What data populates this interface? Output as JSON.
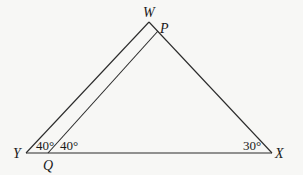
{
  "diagram": {
    "type": "geometry-triangle",
    "vertices": {
      "W": {
        "label": "W",
        "x": 149,
        "y": 22
      },
      "P": {
        "label": "P",
        "x": 158,
        "y": 27
      },
      "Y": {
        "label": "Y",
        "x": 26,
        "y": 153
      },
      "Q": {
        "label": "Q",
        "x": 48,
        "y": 153
      },
      "X": {
        "label": "X",
        "x": 272,
        "y": 153
      }
    },
    "segments": [
      {
        "from": "Y",
        "to": "W"
      },
      {
        "from": "W",
        "to": "X"
      },
      {
        "from": "Y",
        "to": "X"
      },
      {
        "from": "Q",
        "to": "P"
      }
    ],
    "angles": {
      "at_Y": {
        "label": "40°"
      },
      "at_Q": {
        "label": "40°"
      },
      "at_X": {
        "label": "30°"
      }
    }
  }
}
